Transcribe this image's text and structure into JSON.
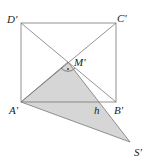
{
  "diagram": {
    "type": "geometry",
    "colors": {
      "line": "#777777",
      "fill": "#d6d6d6",
      "text": "#222222"
    },
    "points": {
      "D": {
        "label": "D'",
        "x": 21,
        "y": 23
      },
      "C": {
        "label": "C'",
        "x": 116,
        "y": 23
      },
      "A": {
        "label": "A'",
        "x": 21,
        "y": 102
      },
      "B": {
        "label": "B'",
        "x": 116,
        "y": 102
      },
      "M": {
        "label": "M'",
        "x": 68,
        "y": 62
      },
      "S": {
        "label": "S'",
        "x": 130,
        "y": 142
      },
      "h": {
        "label": "h",
        "x": 97,
        "y": 102
      }
    },
    "right_angle_marker": "·"
  }
}
